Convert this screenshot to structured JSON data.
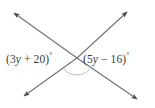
{
  "figure": {
    "background_color": "#ffffff",
    "line_color": "#6f6f6f",
    "text_color": "#3a3a3a",
    "arc_color": "#b9b9b9",
    "width": 155,
    "height": 108
  },
  "labels": {
    "left": {
      "full_text": "(3y + 20)°",
      "prefix": "(3",
      "variable": "y",
      "operator": " + ",
      "constant": "20)",
      "degree": "°"
    },
    "right": {
      "full_text": "(5y − 16)°",
      "prefix": "(5",
      "variable": "y",
      "operator": " − ",
      "constant": "16)",
      "degree": "°"
    }
  },
  "geometry": {
    "intersection": {
      "x": 77,
      "y": 58
    },
    "line_a": {
      "x1": 14,
      "y1": 13,
      "x2": 137,
      "y2": 99,
      "name": "line-top-left-to-bottom-right"
    },
    "line_b": {
      "x1": 24,
      "y1": 96,
      "x2": 127,
      "y2": 12,
      "name": "line-bottom-left-to-top-right"
    },
    "arrow_endpoints": [
      {
        "name": "arrow-top-left",
        "x": 13,
        "y": 12
      },
      {
        "name": "arrow-top-right",
        "x": 128,
        "y": 11
      },
      {
        "name": "arrow-bottom-left",
        "x": 23,
        "y": 97
      },
      {
        "name": "arrow-bottom-right",
        "x": 138,
        "y": 100
      }
    ],
    "angle_arc": {
      "cx": 77,
      "cy": 58,
      "radius": 17,
      "name": "bottom-angle-arc"
    }
  }
}
